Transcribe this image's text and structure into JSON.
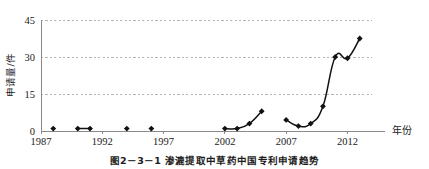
{
  "figure": {
    "caption": "图2－3－1  渗漉提取中草药中国专利申请趋势"
  },
  "chart_data": {
    "type": "line",
    "title": "",
    "xlabel": "年份",
    "ylabel": "申请量/件",
    "xlim": [
      1987,
      2014
    ],
    "ylim": [
      0,
      45
    ],
    "yticks": [
      0,
      15,
      30,
      45
    ],
    "ytick_labels": [
      "0",
      "15",
      "30",
      "45"
    ],
    "xticks": [
      1987,
      1992,
      1997,
      2002,
      2007,
      2012
    ],
    "xtick_labels": [
      "1987",
      "1992",
      "1997",
      "2002",
      "2007",
      "2012"
    ],
    "grid": "horizontal-dashed",
    "legend": "none",
    "marker": "filled-diamond",
    "line_color": "#111111",
    "marker_color": "#111111",
    "grid_color": "#b4b4b4",
    "axis_color": "#8a8a8a",
    "segments": [
      {
        "name": "isolated-early-points",
        "connected": false,
        "x": [
          1988,
          1990,
          1991,
          1994,
          1996
        ],
        "y": [
          1,
          1,
          1,
          1,
          1
        ]
      },
      {
        "name": "1990-1991-pair",
        "connected": true,
        "x": [
          1990,
          1991
        ],
        "y": [
          1,
          1
        ]
      },
      {
        "name": "2002-2005-run",
        "connected": true,
        "x": [
          2002,
          2003,
          2004,
          2005
        ],
        "y": [
          1,
          1,
          3,
          8
        ]
      },
      {
        "name": "2007-2013-run",
        "connected": true,
        "x": [
          2007,
          2008,
          2009,
          2010,
          2011,
          2012,
          2013
        ],
        "y": [
          4.5,
          2,
          3,
          10,
          30,
          29.5,
          37.5
        ]
      }
    ],
    "all_points": [
      {
        "year": 1988,
        "value": 1
      },
      {
        "year": 1990,
        "value": 1
      },
      {
        "year": 1991,
        "value": 1
      },
      {
        "year": 1994,
        "value": 1
      },
      {
        "year": 1996,
        "value": 1
      },
      {
        "year": 2002,
        "value": 1
      },
      {
        "year": 2003,
        "value": 1
      },
      {
        "year": 2004,
        "value": 3
      },
      {
        "year": 2005,
        "value": 8
      },
      {
        "year": 2007,
        "value": 4.5
      },
      {
        "year": 2008,
        "value": 2
      },
      {
        "year": 2009,
        "value": 3
      },
      {
        "year": 2010,
        "value": 10
      },
      {
        "year": 2011,
        "value": 30
      },
      {
        "year": 2012,
        "value": 29.5
      },
      {
        "year": 2013,
        "value": 37.5
      }
    ]
  }
}
